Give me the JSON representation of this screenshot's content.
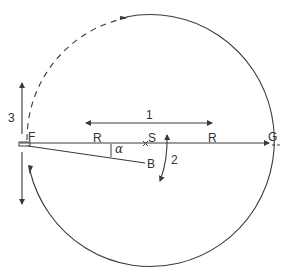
{
  "diagram": {
    "labels": {
      "F": "F",
      "G": "G",
      "S": "S",
      "B": "B",
      "R_left": "R",
      "R_right": "R",
      "alpha": "α",
      "arrow1": "1",
      "arrow2": "2",
      "arrow3": "3"
    },
    "colors": {
      "stroke": "#3a3a3a",
      "background": "#ffffff"
    },
    "elements": [
      {
        "id": "circle-orbit",
        "description": "Circle centered at S passing through F and G, solid except dashed upper-left arc from F to top"
      },
      {
        "id": "line-FG",
        "description": "Horizontal line F to G through S, arrow at G"
      },
      {
        "id": "line-FB",
        "description": "Line from F to B at angle alpha below FG"
      },
      {
        "id": "arrow-1",
        "description": "Horizontal double-headed arrow above FG"
      },
      {
        "id": "arrow-2",
        "description": "Curved double-headed arrow near S"
      },
      {
        "id": "arrow-3",
        "description": "Vertical double-headed arrow through F"
      }
    ]
  }
}
